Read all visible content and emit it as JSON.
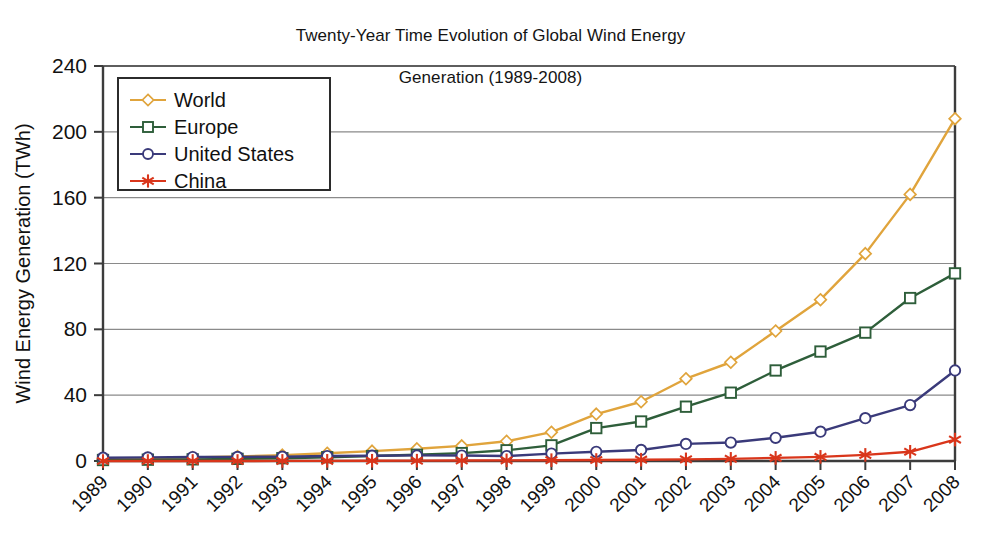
{
  "chart_data": {
    "type": "line",
    "title": "Twenty-Year Time Evolution of Global Wind Energy Generation (1989-2008)",
    "title_line1": "Twenty-Year Time Evolution of Global Wind Energy",
    "title_line2": "Generation (1989-2008)",
    "xlabel": "",
    "ylabel": "Wind Energy Generation (TWh)",
    "ylim": [
      0,
      240
    ],
    "yticks": [
      0,
      40,
      80,
      120,
      160,
      200,
      240
    ],
    "ytick_labels": [
      "0",
      "40",
      "80",
      "120",
      "160",
      "200",
      "240"
    ],
    "grid": "horizontal",
    "legend_position": "upper-left-inside",
    "categories": [
      1989,
      1990,
      1991,
      1992,
      1993,
      1994,
      1995,
      1996,
      1997,
      1998,
      1999,
      2000,
      2001,
      2002,
      2003,
      2004,
      2005,
      2006,
      2007,
      2008
    ],
    "xtick_labels": [
      "1989",
      "1990",
      "1991",
      "1992",
      "1993",
      "1994",
      "1995",
      "1996",
      "1997",
      "1998",
      "1999",
      "2000",
      "2001",
      "2002",
      "2003",
      "2004",
      "2005",
      "2006",
      "2007",
      "2008"
    ],
    "series": [
      {
        "name": "World",
        "color": "#E0A43C",
        "marker": "diamond",
        "values": [
          1.0,
          1.6,
          2.2,
          2.8,
          3.6,
          4.7,
          6.0,
          7.4,
          9.2,
          12.0,
          17.5,
          28.5,
          36.0,
          50.0,
          60.0,
          79.0,
          98.0,
          126.0,
          162.0,
          208.0
        ]
      },
      {
        "name": "Europe",
        "color": "#2E5E3A",
        "marker": "square",
        "values": [
          0.6,
          0.8,
          1.0,
          1.3,
          1.7,
          2.3,
          3.0,
          3.8,
          4.8,
          6.5,
          9.5,
          20.0,
          24.0,
          33.0,
          41.5,
          55.0,
          66.5,
          78.0,
          99.0,
          114.0
        ]
      },
      {
        "name": "United States",
        "color": "#3A3A7A",
        "marker": "circle",
        "values": [
          2.0,
          2.2,
          2.4,
          2.5,
          2.6,
          3.0,
          3.2,
          3.4,
          3.3,
          3.0,
          4.5,
          5.6,
          6.7,
          10.4,
          11.2,
          14.1,
          17.8,
          26.0,
          34.0,
          55.0
        ]
      },
      {
        "name": "China",
        "color": "#D9361B",
        "marker": "asterisk",
        "values": [
          0.0,
          0.0,
          0.0,
          0.0,
          0.05,
          0.1,
          0.15,
          0.2,
          0.3,
          0.4,
          0.5,
          0.6,
          0.8,
          1.0,
          1.3,
          1.9,
          2.5,
          3.7,
          5.6,
          13.0
        ]
      }
    ]
  },
  "legend": {
    "items": [
      {
        "label": "World"
      },
      {
        "label": "Europe"
      },
      {
        "label": "United States"
      },
      {
        "label": "China"
      }
    ]
  },
  "colors": {
    "world": "#E0A43C",
    "europe": "#2E5E3A",
    "united_states": "#3A3A7A",
    "china": "#D9361B",
    "axis": "#3c3c3c",
    "grid": "#8a8a8a",
    "background": "#ffffff"
  }
}
